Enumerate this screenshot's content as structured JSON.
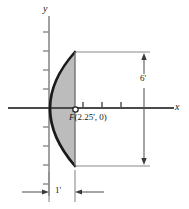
{
  "figure": {
    "axes": {
      "y_label": "y",
      "x_label": "x",
      "origin": {
        "x": 49,
        "y": 108
      }
    },
    "focus": {
      "label_f": "F",
      "label_coords": "(2.25', 0)",
      "marker": "open-circle",
      "x_value": 2.25,
      "y_value": 0
    },
    "dimensions": {
      "vertical": {
        "label": "6'",
        "value": 6,
        "unit": "ft",
        "orientation": "vertical",
        "arrows": "double"
      },
      "horizontal": {
        "label": "1'",
        "value": 1,
        "unit": "ft",
        "orientation": "horizontal",
        "arrows": "double-inward"
      }
    },
    "shape": {
      "type": "parabola",
      "opens": "right",
      "fill_color": "#bcbcbc",
      "stroke_color": "#1a1a1a",
      "depth": 1,
      "aperture": 6
    },
    "colors": {
      "axis": "#8a8a8a",
      "curve": "#1a1a1a",
      "fill": "#bcbcbc",
      "dimension_line": "#8a8a8a",
      "background": "#ffffff"
    }
  }
}
